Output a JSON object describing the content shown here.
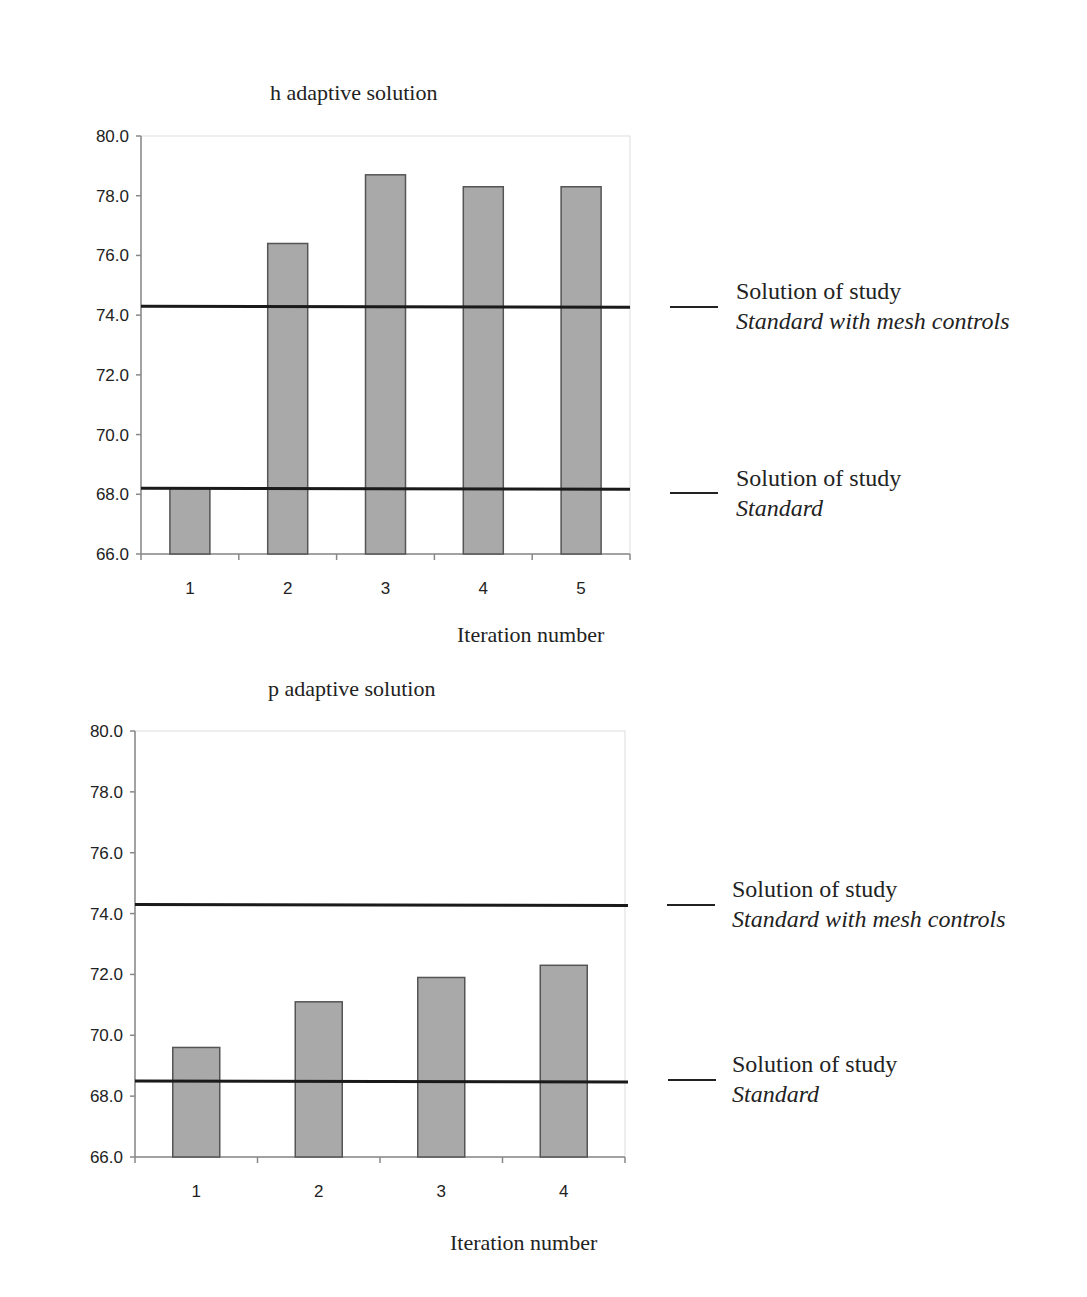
{
  "charts": [
    {
      "title": "h adaptive solution",
      "xlabel": "Iteration number",
      "legend": [
        {
          "line1": "Solution of study",
          "line2": "Standard with mesh controls"
        },
        {
          "line1": "Solution of study",
          "line2": "Standard"
        }
      ]
    },
    {
      "title": "p adaptive solution",
      "xlabel": "Iteration number",
      "legend": [
        {
          "line1": "Solution of study",
          "line2": "Standard with mesh controls"
        },
        {
          "line1": "Solution of study",
          "line2": "Standard"
        }
      ]
    }
  ],
  "colors": {
    "bar_fill": "#a9a9a9",
    "bar_stroke": "#555555",
    "ref_line": "#1a1a1a",
    "axis": "#888888"
  },
  "chart_data": [
    {
      "type": "bar",
      "title": "h adaptive solution",
      "xlabel": "Iteration number",
      "ylabel": "",
      "categories": [
        "1",
        "2",
        "3",
        "4",
        "5"
      ],
      "values": [
        68.2,
        76.4,
        78.7,
        78.3,
        78.3
      ],
      "ylim": [
        66.0,
        80.0
      ],
      "yticks": [
        "66.0",
        "68.0",
        "70.0",
        "72.0",
        "74.0",
        "76.0",
        "78.0",
        "80.0"
      ],
      "reference_lines": [
        {
          "label": "Solution of study Standard with mesh controls",
          "value": 74.3
        },
        {
          "label": "Solution of study Standard",
          "value": 68.2
        }
      ],
      "grid": false,
      "legend_position": "right"
    },
    {
      "type": "bar",
      "title": "p adaptive solution",
      "xlabel": "Iteration number",
      "ylabel": "",
      "categories": [
        "1",
        "2",
        "3",
        "4"
      ],
      "values": [
        69.6,
        71.1,
        71.9,
        72.3
      ],
      "ylim": [
        66.0,
        80.0
      ],
      "yticks": [
        "66.0",
        "68.0",
        "70.0",
        "72.0",
        "74.0",
        "76.0",
        "78.0",
        "80.0"
      ],
      "reference_lines": [
        {
          "label": "Solution of study Standard with mesh controls",
          "value": 74.3
        },
        {
          "label": "Solution of study Standard",
          "value": 68.5
        }
      ],
      "grid": false,
      "legend_position": "right"
    }
  ]
}
